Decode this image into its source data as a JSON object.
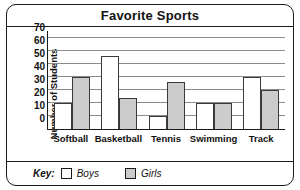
{
  "chart_data": {
    "type": "bar",
    "title": "Favorite Sports",
    "xlabel": "",
    "ylabel": "Number of Students",
    "categories": [
      "Softball",
      "Basketball",
      "Tennis",
      "Swimming",
      "Track"
    ],
    "series": [
      {
        "name": "Boys",
        "values": [
          20,
          56,
          10,
          20,
          40
        ],
        "color": "#ffffff"
      },
      {
        "name": "Girls",
        "values": [
          40,
          24,
          36,
          20,
          30
        ],
        "color": "#cccccc"
      }
    ],
    "ylim": [
      0,
      75
    ],
    "yticks": [
      0,
      10,
      20,
      30,
      40,
      50,
      60,
      70
    ],
    "grid": true,
    "legend_position": "bottom",
    "legend_title": "Key:"
  }
}
